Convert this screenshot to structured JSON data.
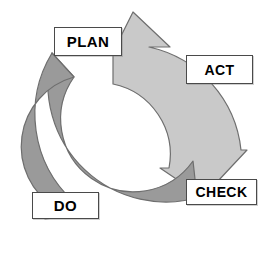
{
  "diagram": {
    "type": "cyclic-arrow-diagram",
    "background_color": "#ffffff",
    "stages": [
      {
        "id": "plan",
        "label": "PLAN",
        "position": "top-left"
      },
      {
        "id": "act",
        "label": "ACT",
        "position": "right-top"
      },
      {
        "id": "check",
        "label": "CHECK",
        "position": "right-bottom"
      },
      {
        "id": "do",
        "label": "DO",
        "position": "bottom-left"
      }
    ],
    "arrows": [
      {
        "id": "light-arc",
        "name": "upper-right-arrow",
        "color": "#c9c9c9",
        "stroke": "#6e6e6e",
        "from": "plan",
        "to": "check",
        "direction": "clockwise"
      },
      {
        "id": "dark-arc",
        "name": "lower-left-arrow",
        "color": "#9a9a9a",
        "stroke": "#6e6e6e",
        "from": "check",
        "to": "plan",
        "direction": "clockwise"
      }
    ],
    "label_box": {
      "fill": "#ffffff",
      "border_color": "#4a4a4a",
      "text_color": "#000000"
    }
  }
}
